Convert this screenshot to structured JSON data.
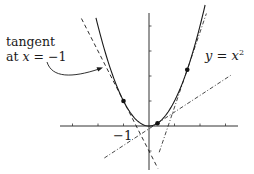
{
  "chart_data": {
    "type": "line",
    "title": "",
    "xlabel": "",
    "ylabel": "",
    "xlim": [
      -3.6,
      3.6
    ],
    "ylim": [
      -1.9,
      4.5
    ],
    "grid": false,
    "x_ticks": [
      -3,
      -2,
      -1,
      1,
      2,
      3
    ],
    "y_ticks": [
      -1,
      1,
      2,
      3,
      4
    ],
    "labeled_ticks": [
      {
        "axis": "x",
        "value": -1,
        "label": "−1"
      }
    ],
    "series": [
      {
        "name": "y = x^2",
        "kind": "curve",
        "style": "solid",
        "function": "x^2",
        "x_range": [
          -2.08,
          2.2
        ]
      },
      {
        "name": "tangent at x = -1",
        "kind": "line",
        "style": "dashed",
        "slope": -2,
        "intercept": -1,
        "x_range": [
          -2.65,
          0.35
        ]
      },
      {
        "name": "tangent at x = 1/3",
        "kind": "line",
        "style": "dashdot",
        "slope": 0.667,
        "intercept": -0.111,
        "x_range": [
          -1.75,
          3.2
        ]
      },
      {
        "name": "tangent at x = 1.5",
        "kind": "line",
        "style": "dashdot",
        "slope": 3,
        "intercept": -2.25,
        "x_range": [
          0.4,
          2.25
        ]
      }
    ],
    "points": [
      {
        "x": -1,
        "y": 1
      },
      {
        "x": 0.333,
        "y": 0.111
      },
      {
        "x": 1.5,
        "y": 2.25
      }
    ],
    "annotations": [
      {
        "text": "tangent at x = −1",
        "arrow_to": "tangent at x = -1"
      },
      {
        "text": "y = x²",
        "target": "y = x^2"
      }
    ]
  },
  "labels": {
    "annotation_line1": "tangent",
    "annotation_line2_prefix": "at ",
    "annotation_var": "x",
    "annotation_line2_suffix": " = −1",
    "curve_y": "y",
    "curve_eq": " = ",
    "curve_x": "x",
    "curve_exp": "2",
    "tick_minus_one": "−1"
  },
  "colors": {
    "ink": "#1a1a1a",
    "axis": "#333333",
    "background": "#ffffff"
  }
}
